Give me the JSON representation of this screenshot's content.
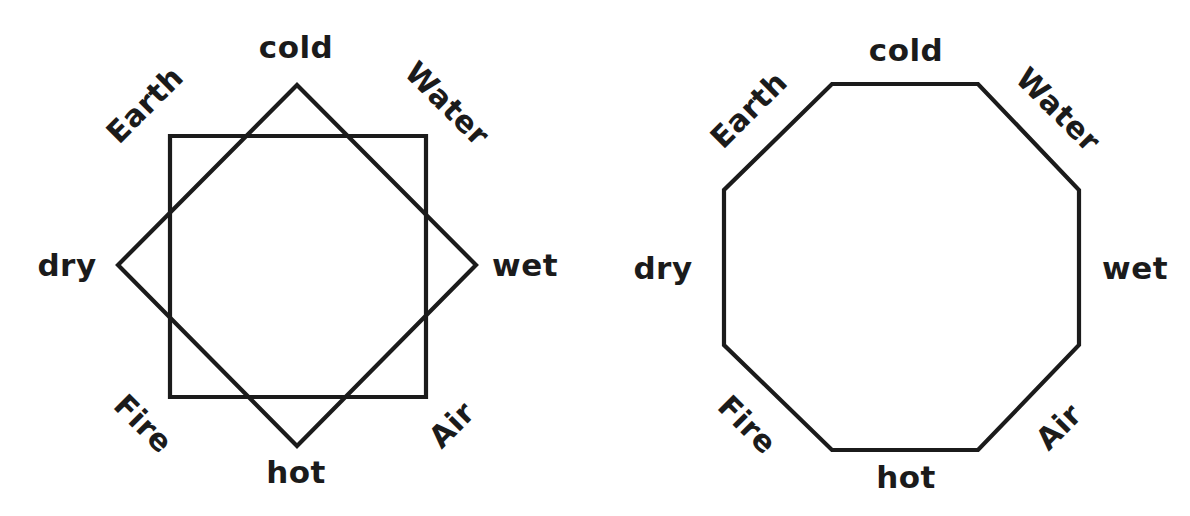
{
  "page": {
    "background_color": "#ffffff",
    "stroke_color": "#1b1b1b",
    "text_color": "#1b1b1b",
    "width": 1190,
    "height": 516
  },
  "figures": [
    {
      "id": "star-octagram",
      "name": "square-and-diamond-octagram",
      "shapes": [
        {
          "kind": "square",
          "name": "upright-square",
          "points": "170,136 426,136 426,397 170,397"
        },
        {
          "kind": "square",
          "name": "rotated-diamond-square",
          "points": "297,85 476,265 297,446 118,265"
        }
      ],
      "labels": [
        {
          "key": "cold",
          "text": "cold",
          "type": "quality",
          "x": 296,
          "y": 47,
          "rotation": 0
        },
        {
          "key": "water",
          "text": "Water",
          "type": "element",
          "x": 447,
          "y": 104,
          "rotation": 45
        },
        {
          "key": "wet",
          "text": "wet",
          "type": "quality",
          "x": 525,
          "y": 265,
          "rotation": 0
        },
        {
          "key": "air",
          "text": "Air",
          "type": "element",
          "x": 452,
          "y": 425,
          "rotation": -45
        },
        {
          "key": "hot",
          "text": "hot",
          "type": "quality",
          "x": 296,
          "y": 472,
          "rotation": 0
        },
        {
          "key": "fire",
          "text": "Fire",
          "type": "element",
          "x": 143,
          "y": 424,
          "rotation": 45
        },
        {
          "key": "dry",
          "text": "dry",
          "type": "quality",
          "x": 67,
          "y": 265,
          "rotation": 0
        },
        {
          "key": "earth",
          "text": "Earth",
          "type": "element",
          "x": 145,
          "y": 105,
          "rotation": -45
        }
      ]
    },
    {
      "id": "octagon",
      "name": "regular-octagon",
      "shapes": [
        {
          "kind": "octagon",
          "name": "regular-octagon-outline",
          "points": "237,84 383,84 484,190 484,345 383,450 237,450 129,345 129,190"
        }
      ],
      "labels": [
        {
          "key": "cold",
          "text": "cold",
          "type": "quality",
          "x": 311,
          "y": 50,
          "rotation": 0
        },
        {
          "key": "water",
          "text": "Water",
          "type": "element",
          "x": 463,
          "y": 110,
          "rotation": 45
        },
        {
          "key": "wet",
          "text": "wet",
          "type": "quality",
          "x": 540,
          "y": 268,
          "rotation": 0
        },
        {
          "key": "air",
          "text": "Air",
          "type": "element",
          "x": 464,
          "y": 427,
          "rotation": -45
        },
        {
          "key": "hot",
          "text": "hot",
          "type": "quality",
          "x": 311,
          "y": 477,
          "rotation": 0
        },
        {
          "key": "fire",
          "text": "Fire",
          "type": "element",
          "x": 152,
          "y": 425,
          "rotation": 45
        },
        {
          "key": "dry",
          "text": "dry",
          "type": "quality",
          "x": 68,
          "y": 268,
          "rotation": 0
        },
        {
          "key": "earth",
          "text": "Earth",
          "type": "element",
          "x": 154,
          "y": 110,
          "rotation": -45
        }
      ]
    }
  ],
  "legend_terms": {
    "qualities": [
      "cold",
      "wet",
      "hot",
      "dry"
    ],
    "elements": [
      "Earth",
      "Water",
      "Air",
      "Fire"
    ]
  }
}
